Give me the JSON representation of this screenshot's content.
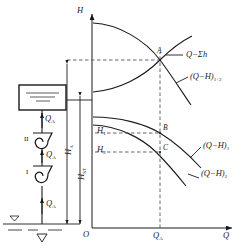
{
  "figure": {
    "type": "technical-diagram",
    "axes": {
      "y_label": "H",
      "x_label": "Q",
      "origin_label": "O",
      "x_tick_label": "Q",
      "x_tick_sub": "A"
    },
    "curves": [
      {
        "id": "system",
        "label_main": "Q−Σh",
        "label_sub": "",
        "paren": false
      },
      {
        "id": "pump-series",
        "label_main": "(Q−H)",
        "label_sub": "1+2",
        "paren": true
      },
      {
        "id": "pump-1",
        "label_main": "(Q−H)",
        "label_sub": "1",
        "paren": true
      },
      {
        "id": "pump-2",
        "label_main": "(Q−H)",
        "label_sub": "2",
        "paren": true
      }
    ],
    "points": [
      {
        "name": "A",
        "label": "A",
        "meaning": "duty point of series combination"
      },
      {
        "name": "B",
        "label": "B",
        "meaning": "head of pump 1 at Q-A"
      },
      {
        "name": "C",
        "label": "C",
        "meaning": "head of pump 2 at Q-A"
      }
    ],
    "head_levels": [
      {
        "label_main": "H",
        "label_sub": "1"
      },
      {
        "label_main": "H",
        "label_sub": "2"
      }
    ],
    "dimensions": [
      {
        "id": "h-a",
        "label_main": "H",
        "label_sub": "A",
        "meaning": "total head at duty point"
      },
      {
        "id": "h-st",
        "label_main": "H",
        "label_sub": "ST",
        "meaning": "static lift"
      }
    ],
    "schematic": {
      "tank_name": "discharge-reservoir",
      "pumps": [
        {
          "id": "pump-II",
          "label": "II"
        },
        {
          "id": "pump-I",
          "label": "I"
        }
      ],
      "flow_labels": [
        {
          "label_main": "Q",
          "label_sub": "A"
        },
        {
          "label_main": "Q",
          "label_sub": "A"
        },
        {
          "label_main": "Q",
          "label_sub": "A"
        }
      ],
      "water_surface_symbol": "▽"
    },
    "colors": {
      "ink": "#1a1a1a",
      "dash": "#555555",
      "paper": "#ffffff"
    }
  }
}
